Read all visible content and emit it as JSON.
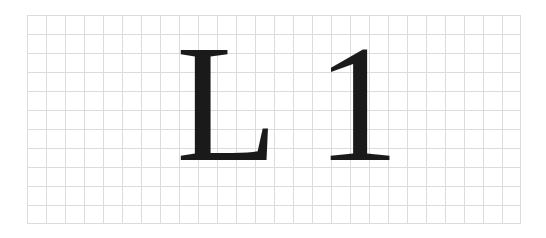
{
  "grid": {
    "columns": 26,
    "rows": 11,
    "cell_size_px": 19,
    "line_color": "#dcdcdc"
  },
  "glyphs": {
    "first": "L",
    "second": "1",
    "color": "#1a1a1a"
  }
}
